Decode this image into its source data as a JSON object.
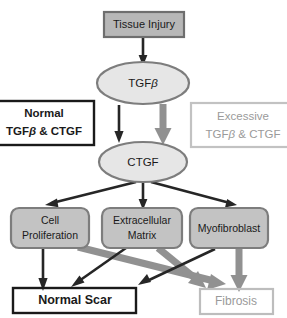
{
  "figure": {
    "colors": {
      "box_fill_dark": "#b7b7b7",
      "box_fill_light": "#dcdcdc",
      "ellipse_fill": "#e6e6e6",
      "stroke_dark": "#262626",
      "stroke_gray": "#919191",
      "text_dark": "#1a1a1a",
      "text_gray": "#9a9a9a",
      "background": "#ffffff"
    }
  },
  "nodes": {
    "tissue_injury": {
      "label": "Tissue  Injury",
      "shape": "rect",
      "style": "filled-dark"
    },
    "tgfb": {
      "label": "TGF",
      "label_suffix": "β",
      "shape": "ellipse",
      "style": "filled-light"
    },
    "ctgf": {
      "label": "CTGF",
      "shape": "ellipse",
      "style": "filled-light"
    },
    "cell_proliferation": {
      "line1": "Cell",
      "line2": "Proliferation",
      "shape": "rounded-rect",
      "style": "filled-dark"
    },
    "extracellular_matrix": {
      "line1": "Extracellular",
      "line2": "Matrix",
      "shape": "rounded-rect",
      "style": "filled-dark"
    },
    "myofibroblast": {
      "label": "Myofibroblast",
      "shape": "rounded-rect",
      "style": "filled-dark"
    },
    "normal_scar": {
      "label": "Normal Scar",
      "shape": "rect",
      "style": "outline-dark"
    },
    "fibrosis": {
      "label": "Fibrosis",
      "shape": "rect",
      "style": "outline-gray"
    }
  },
  "annotations": {
    "normal": {
      "line1": "Normal",
      "line2_pre": "TGF",
      "line2_beta": "β",
      "line2_post": " & CTGF",
      "style": "outline-dark",
      "emphasis": "bold-black"
    },
    "excessive": {
      "line1": "Excessive",
      "line2_pre": "TGF",
      "line2_beta": "β",
      "line2_post": " & CTGF",
      "style": "outline-gray",
      "emphasis": "gray"
    }
  },
  "edges": [
    {
      "from": "tissue_injury",
      "to": "tgfb",
      "weight": "thin",
      "color": "dark"
    },
    {
      "from": "tgfb",
      "to": "ctgf",
      "weight": "thin",
      "color": "dark",
      "branch": "normal"
    },
    {
      "from": "tgfb",
      "to": "ctgf",
      "weight": "thick",
      "color": "gray",
      "branch": "excessive"
    },
    {
      "from": "ctgf",
      "to": "cell_proliferation",
      "weight": "thin",
      "color": "dark"
    },
    {
      "from": "ctgf",
      "to": "extracellular_matrix",
      "weight": "thin",
      "color": "dark"
    },
    {
      "from": "ctgf",
      "to": "myofibroblast",
      "weight": "thin",
      "color": "dark"
    },
    {
      "from": "cell_proliferation",
      "to": "normal_scar",
      "weight": "thin",
      "color": "dark"
    },
    {
      "from": "cell_proliferation",
      "to": "fibrosis",
      "weight": "thick",
      "color": "gray"
    },
    {
      "from": "extracellular_matrix",
      "to": "normal_scar",
      "weight": "thin",
      "color": "dark"
    },
    {
      "from": "extracellular_matrix",
      "to": "fibrosis",
      "weight": "thick",
      "color": "gray"
    },
    {
      "from": "myofibroblast",
      "to": "normal_scar",
      "weight": "thin",
      "color": "dark"
    },
    {
      "from": "myofibroblast",
      "to": "fibrosis",
      "weight": "thick",
      "color": "gray"
    }
  ]
}
